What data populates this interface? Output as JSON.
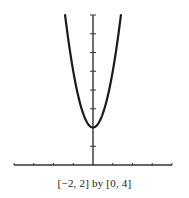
{
  "chart_data": {
    "type": "line",
    "title": "",
    "caption": "[−2, 2] by [0, 4]",
    "xlabel": "",
    "ylabel": "",
    "xlim": [
      -2,
      2
    ],
    "ylim": [
      0,
      4
    ],
    "x_tick_step": 0.5,
    "y_tick_step": 0.5,
    "grid": false,
    "legend": null,
    "series": [
      {
        "name": "y = 6x^2 + 1 (parabola, vertex at (0, 1))",
        "x": [
          -0.707,
          -0.6,
          -0.5,
          -0.4,
          -0.3,
          -0.2,
          -0.1,
          0,
          0.1,
          0.2,
          0.3,
          0.4,
          0.5,
          0.6,
          0.707
        ],
        "y": [
          4.0,
          3.16,
          2.5,
          1.96,
          1.54,
          1.24,
          1.06,
          1.0,
          1.06,
          1.24,
          1.54,
          1.96,
          2.5,
          3.16,
          4.0
        ]
      }
    ]
  },
  "colors": {
    "axis": "#333333",
    "curve": "#1a1a1a",
    "background": "#ffffff"
  }
}
